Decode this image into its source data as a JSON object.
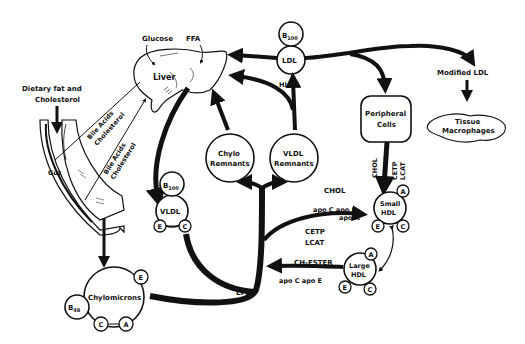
{
  "labels": {
    "glucose": "Glucose",
    "ffa": "FFA",
    "liver": "Liver",
    "dietary_line1": "Dietary fat and",
    "dietary_line2": "Cholesterol",
    "gut": "Gut",
    "bile1_line1": "Bile Acids",
    "bile1_line2": "Cholesterol",
    "bile2_line1": "Bile Acids",
    "bile2_line2": "Cholesterol",
    "hl": "HL",
    "lpl": "LPL",
    "modified_ldl": "Modified LDL",
    "tissue_line1": "Tissue",
    "tissue_line2": "Macrophages",
    "peripheral_line1": "Peripheral",
    "peripheral_line2": "Cells",
    "chol_vertical": "CHOL",
    "cetp_vertical": "CETP",
    "lcat_vertical": "LCAT",
    "chol_arrow": "CHOL",
    "apoc_apoe_top": "apo C  apo E",
    "apoa_top": "apo A",
    "cetp": "CETP",
    "lcat": "LCAT",
    "ch_ester": "CH-ESTER",
    "apoc_apoe_bottom": "apo C  apo E"
  },
  "nodes": {
    "ldl": {
      "label": "LDL",
      "apo": "B",
      "apo_sub": "100"
    },
    "vldl": {
      "label": "VLDL",
      "apo": "B",
      "apo_sub": "100",
      "sats": [
        "E",
        "C"
      ]
    },
    "chylo_remnants": {
      "line1": "Chylo",
      "line2": "Remnants"
    },
    "vldl_remnants": {
      "line1": "VLDL",
      "line2": "Remnants"
    },
    "chylomicrons": {
      "label": "Chylomicrons",
      "apo": "B",
      "apo_sub": "48",
      "sats": [
        "E",
        "C",
        "A"
      ]
    },
    "small_hdl": {
      "line1": "Small",
      "line2": "HDL",
      "sats": [
        "A",
        "E",
        "C"
      ]
    },
    "large_hdl": {
      "line1": "Large",
      "line2": "HDL",
      "sats": [
        "A",
        "E",
        "C"
      ]
    }
  }
}
